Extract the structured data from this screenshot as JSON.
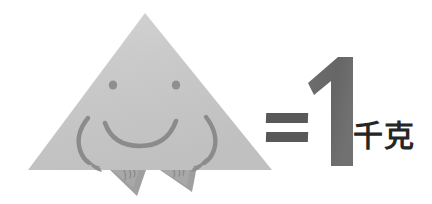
{
  "scene": {
    "width": 432,
    "height": 204,
    "background_color": "#ffffff",
    "description": "Cartoon gray triangle with a smiling face equals 1 kilogram"
  },
  "equation": {
    "equals_symbol": "=",
    "quantity": "1",
    "unit": "千克",
    "full_text": "= 1 千克",
    "equals_color": "#585858",
    "numeral_color": "#6b6b6b",
    "unit_color": "#262626"
  },
  "character": {
    "name": "smiling-triangle",
    "body_shape": "triangle",
    "fill_color": "#c6c6c6",
    "fill_color_light": "#d2d2d2",
    "ink_color": "#8a8a8a",
    "apex": {
      "x": 145,
      "y": 13
    },
    "bottom_left": {
      "x": 28,
      "y": 170
    },
    "bottom_right": {
      "x": 272,
      "y": 170
    },
    "features": {
      "left_eye": {
        "x": 113,
        "y": 85,
        "r": 4
      },
      "right_eye": {
        "x": 176,
        "y": 85,
        "r": 4
      },
      "mouth": "smile-curve",
      "left_arm": "curved-arm-with-hand",
      "right_arm": "curved-arm-with-hand",
      "left_foot": "triangular-foot",
      "right_foot": "triangular-foot"
    }
  },
  "icons": {
    "triangle": "triangle-icon",
    "eye": "eye-dot-icon",
    "smile": "smile-icon",
    "arm": "arm-icon",
    "foot": "foot-icon",
    "equals": "equals-icon",
    "numeral": "numeral-one-icon"
  }
}
